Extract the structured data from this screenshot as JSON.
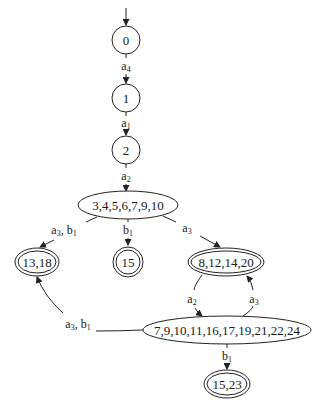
{
  "diagram": {
    "type": "state-machine",
    "nodes": [
      {
        "id": "n0",
        "label": "0",
        "shape": "circle",
        "accepting": false,
        "initial": true
      },
      {
        "id": "n1",
        "label": "1",
        "shape": "circle",
        "accepting": false
      },
      {
        "id": "n2",
        "label": "2",
        "shape": "circle",
        "accepting": false
      },
      {
        "id": "n3",
        "label": "3,4,5,6,7,9,10",
        "shape": "ellipse",
        "accepting": false
      },
      {
        "id": "n4",
        "label": "13,18",
        "shape": "ellipse",
        "accepting": true
      },
      {
        "id": "n5",
        "label": "15",
        "shape": "circle",
        "accepting": true
      },
      {
        "id": "n6",
        "label": "8,12,14,20",
        "shape": "ellipse",
        "accepting": true
      },
      {
        "id": "n7",
        "label": "7,9,10,11,16,17,19,21,22,24",
        "shape": "ellipse",
        "accepting": false
      },
      {
        "id": "n8",
        "label": "15,23",
        "shape": "ellipse",
        "accepting": true
      }
    ],
    "edges": [
      {
        "from": "n0",
        "to": "n1",
        "label": {
          "base": "a",
          "sub": "4"
        }
      },
      {
        "from": "n1",
        "to": "n2",
        "label": {
          "base": "a",
          "sub": "1"
        }
      },
      {
        "from": "n2",
        "to": "n3",
        "label": {
          "base": "a",
          "sub": "2"
        }
      },
      {
        "from": "n3",
        "to": "n4",
        "label": {
          "parts": [
            {
              "base": "a",
              "sub": "3"
            },
            {
              "base": "b",
              "sub": "1"
            }
          ]
        }
      },
      {
        "from": "n3",
        "to": "n5",
        "label": {
          "base": "b",
          "sub": "1"
        }
      },
      {
        "from": "n3",
        "to": "n6",
        "label": {
          "base": "a",
          "sub": "3"
        }
      },
      {
        "from": "n6",
        "to": "n7",
        "label": {
          "base": "a",
          "sub": "2"
        }
      },
      {
        "from": "n7",
        "to": "n6",
        "label": {
          "base": "a",
          "sub": "3"
        }
      },
      {
        "from": "n7",
        "to": "n4",
        "label": {
          "parts": [
            {
              "base": "a",
              "sub": "3"
            },
            {
              "base": "b",
              "sub": "1"
            }
          ]
        }
      },
      {
        "from": "n7",
        "to": "n8",
        "label": {
          "base": "b",
          "sub": "1"
        }
      }
    ]
  },
  "labels": {
    "n0": "0",
    "n1": "1",
    "n2": "2",
    "n3": "3,4,5,6,7,9,10",
    "n4": "13,18",
    "n5": "15",
    "n6": "8,12,14,20",
    "n7": "7,9,10,11,16,17,19,21,22,24",
    "n8": "15,23",
    "e01": {
      "base": "a",
      "sub": "4"
    },
    "e12": {
      "base": "a",
      "sub": "1"
    },
    "e23": {
      "base": "a",
      "sub": "2"
    },
    "e34": {
      "a": "a",
      "a_sub": "3",
      "sep": ", ",
      "b": "b",
      "b_sub": "1"
    },
    "e35": {
      "base": "b",
      "sub": "1"
    },
    "e36": {
      "base": "a",
      "sub": "3"
    },
    "e67": {
      "base": "a",
      "sub": "2"
    },
    "e76": {
      "base": "a",
      "sub": "3"
    },
    "e74": {
      "a": "a",
      "a_sub": "3",
      "sep": ", ",
      "b": "b",
      "b_sub": "1"
    },
    "e78": {
      "base": "b",
      "sub": "1"
    }
  },
  "colors": {
    "stroke": "#222222",
    "text": "#1a1a1a",
    "background": "#ffffff"
  }
}
